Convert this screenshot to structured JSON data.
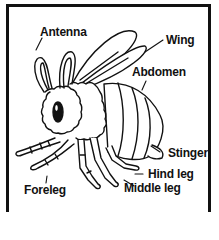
{
  "diagram": {
    "colors": {
      "ink": "#111111",
      "background": "#ffffff"
    },
    "labels": [
      {
        "id": "antenna",
        "text": "Antenna"
      },
      {
        "id": "wing",
        "text": "Wing"
      },
      {
        "id": "abdomen",
        "text": "Abdomen"
      },
      {
        "id": "stinger",
        "text": "Stinger"
      },
      {
        "id": "hind_leg",
        "text": "Hind leg"
      },
      {
        "id": "foreleg",
        "text": "Foreleg"
      },
      {
        "id": "middle_leg",
        "text": "Middle leg"
      }
    ]
  }
}
